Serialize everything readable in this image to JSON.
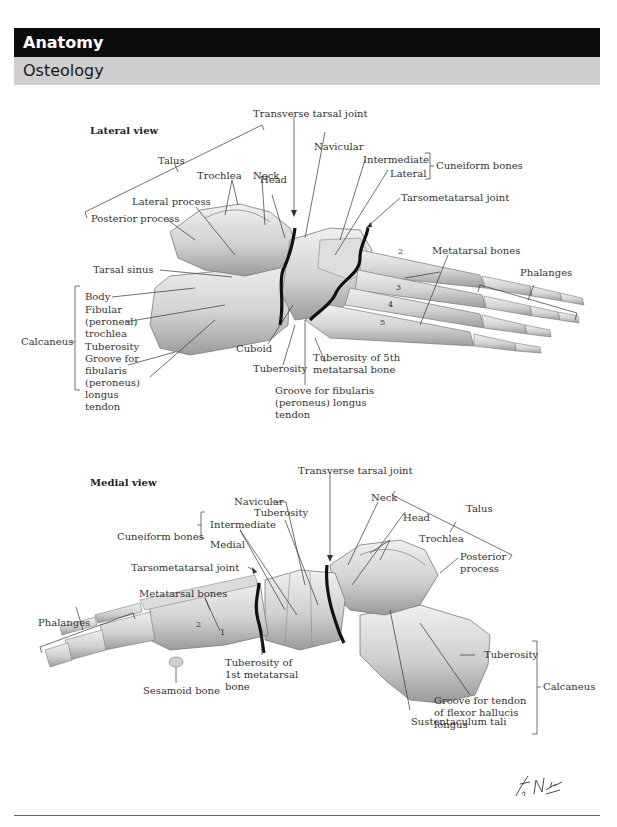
{
  "header": {
    "section": "Anatomy",
    "subsection": "Osteology"
  },
  "lateral_view": {
    "title": "Lateral view",
    "labels": {
      "transverse_tarsal_joint": "Transverse tarsal joint",
      "talus": "Talus",
      "navicular": "Navicular",
      "intermediate": "Intermediate",
      "lateral": "Lateral",
      "cuneiform_bones": "Cuneiform bones",
      "trochlea": "Trochlea",
      "neck": "Neck",
      "head": "Head",
      "lateral_process": "Lateral process",
      "tarsometatarsal_joint": "Tarsometatarsal joint",
      "posterior_process": "Posterior process",
      "metatarsal_bones": "Metatarsal bones",
      "phalanges": "Phalanges",
      "tarsal_sinus": "Tarsal sinus",
      "calcaneus": "Calcaneus",
      "body": "Body",
      "fibular_trochlea": "Fibular (peroneal) trochlea",
      "tuberosity_calc": "Tuberosity",
      "groove_fibularis_calc": "Groove for fibularis (peroneus) longus tendon",
      "cuboid": "Cuboid",
      "tuberosity_cuboid": "Tuberosity",
      "tuberosity_5th": "Tuberosity of 5th metatarsal bone",
      "groove_fibularis_cuboid": "Groove for fibularis (peroneus) longus tendon"
    },
    "metatarsal_numbers": [
      "2",
      "3",
      "4",
      "5"
    ]
  },
  "medial_view": {
    "title": "Medial view",
    "labels": {
      "transverse_tarsal_joint": "Transverse tarsal joint",
      "navicular": "Navicular",
      "tuberosity_nav": "Tuberosity",
      "neck": "Neck",
      "talus": "Talus",
      "head": "Head",
      "cuneiform_bones": "Cuneiform bones",
      "intermediate": "Intermediate",
      "medial": "Medial",
      "trochlea": "Trochlea",
      "tarsometatarsal_joint": "Tarsometatarsal joint",
      "posterior_process": "Posterior process",
      "metatarsal_bones": "Metatarsal bones",
      "phalanges": "Phalanges",
      "tuberosity_1st": "Tuberosity of 1st metatarsal bone",
      "sesamoid_bone": "Sesamoid bone",
      "tuberosity_calc": "Tuberosity",
      "calcaneus": "Calcaneus",
      "groove_fhl": "Groove for tendon of flexor hallucis longus",
      "sustentaculum_tali": "Sustentaculum tali"
    },
    "metatarsal_numbers": [
      "2",
      "1"
    ]
  },
  "signature": "F. Netter M.D.",
  "colors": {
    "header_black": "#0c0c0c",
    "header_gray": "#cfcfcf",
    "bone_light": "#e6e6e6",
    "bone_shade": "#a9a9a9",
    "joint_line": "#111111"
  }
}
